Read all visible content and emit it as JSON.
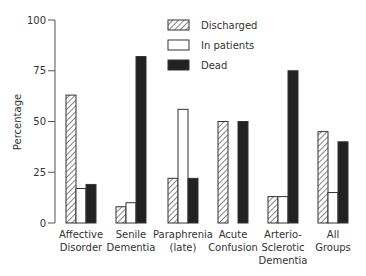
{
  "chart_data": {
    "type": "bar",
    "title": "",
    "xlabel": "",
    "ylabel": "Percentage",
    "ylim": [
      0,
      100
    ],
    "yticks": [
      0,
      25,
      50,
      75,
      100
    ],
    "grid": false,
    "legend_position": "top-center",
    "categories": [
      [
        "Affective",
        "Disorder"
      ],
      [
        "Senile",
        "Dementia"
      ],
      [
        "Paraphrenia",
        "(late)"
      ],
      [
        "Acute",
        "Confusion"
      ],
      [
        "Arterio-",
        "Sclerotic",
        "Dementia"
      ],
      [
        "All",
        "Groups"
      ]
    ],
    "series": [
      {
        "name": "Discharged",
        "style": "hatched",
        "values": [
          63,
          8,
          22,
          50,
          13,
          45
        ]
      },
      {
        "name": "In patients",
        "style": "white",
        "values": [
          17,
          10,
          56,
          0,
          13,
          15
        ]
      },
      {
        "name": "Dead",
        "style": "black",
        "values": [
          19,
          82,
          22,
          50,
          75,
          40
        ]
      }
    ]
  },
  "colors": {
    "axis": "#555555",
    "bar_outline": "#333333",
    "black_fill": "#222222",
    "white_fill": "#ffffff",
    "hatch": "#444444"
  }
}
